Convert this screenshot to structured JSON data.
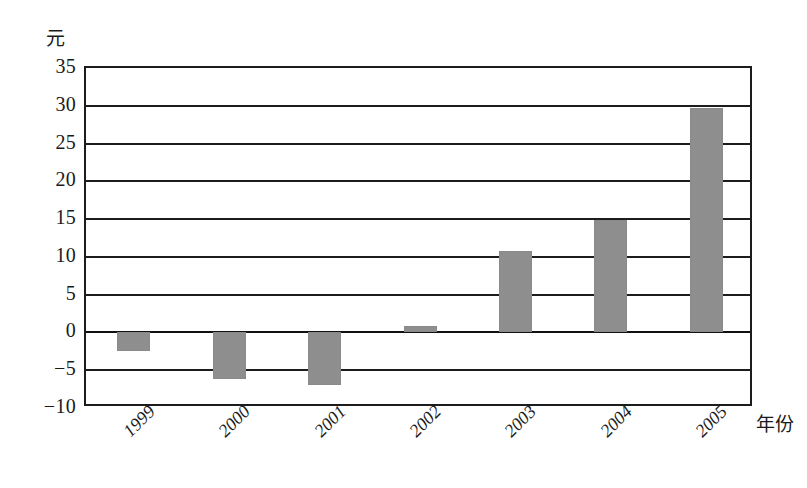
{
  "chart_data": {
    "type": "bar",
    "title": "",
    "xlabel": "年份",
    "ylabel": "元",
    "categories": [
      "1999",
      "2000",
      "2001",
      "2002",
      "2003",
      "2004",
      "2005"
    ],
    "values": [
      -2.5,
      -6.1,
      -7.0,
      0.8,
      10.8,
      14.9,
      29.7
    ],
    "series": [
      {
        "name": "",
        "values": [
          -2.5,
          -6.1,
          -7.0,
          0.8,
          10.8,
          14.9,
          29.7
        ]
      }
    ],
    "ylim": [
      -10,
      35
    ],
    "ytick_labels": [
      "35",
      "30",
      "25",
      "20",
      "15",
      "10",
      "5",
      "0",
      "-5",
      "-10"
    ],
    "ytick_values": [
      35,
      30,
      25,
      20,
      15,
      10,
      5,
      0,
      -5,
      -10
    ],
    "ystep": 5,
    "grid": true,
    "legend": "none",
    "bar_color": "#8e8e8e",
    "axis_color": "#1c1c1c",
    "zero_line_value": 0
  }
}
